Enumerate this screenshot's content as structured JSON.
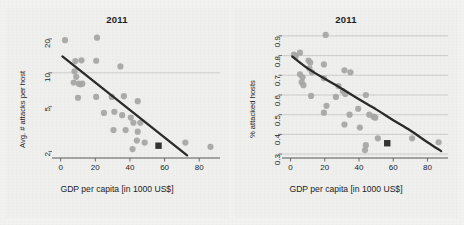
{
  "figure": {
    "background_color": "#f2f2f1",
    "panel_background": "#efefee",
    "point_color": "#a6a6a6",
    "highlight_color": "#333333",
    "fit_line_color": "#2b2b2b",
    "grid_color": "#bfbfbf",
    "axis_color": "#4a4a4a"
  },
  "chart_data": [
    {
      "type": "scatter",
      "panel": "left",
      "title": "2011",
      "xlabel": "GDP per capita [in 1000 US$]",
      "ylabel": "Avg. # attacks per host",
      "xticks": [
        0,
        20,
        40,
        60,
        80
      ],
      "xticklabels": [
        "0",
        "20",
        "40",
        "60",
        "80"
      ],
      "yticks": [
        2,
        5,
        10,
        20
      ],
      "yticklabels": [
        "2",
        "5",
        "10",
        "20"
      ],
      "yscale": "log",
      "xlim": [
        -5,
        92
      ],
      "ylim": [
        1.75,
        24
      ],
      "grid": "y at 10",
      "gridlines": [
        10
      ],
      "legend": "none",
      "points": [
        {
          "x": 2.5,
          "y": 19.5
        },
        {
          "x": 21.0,
          "y": 20.5
        },
        {
          "x": 8.5,
          "y": 12.7
        },
        {
          "x": 12.0,
          "y": 12.9
        },
        {
          "x": 20.5,
          "y": 12.8
        },
        {
          "x": 34.5,
          "y": 11.4
        },
        {
          "x": 8.0,
          "y": 10.3
        },
        {
          "x": 9.0,
          "y": 9.2
        },
        {
          "x": 7.5,
          "y": 8.2
        },
        {
          "x": 10.5,
          "y": 8.0
        },
        {
          "x": 12.5,
          "y": 8.0
        },
        {
          "x": 11.5,
          "y": 7.9
        },
        {
          "x": 10.0,
          "y": 6.0
        },
        {
          "x": 20.5,
          "y": 6.1
        },
        {
          "x": 29.5,
          "y": 6.1
        },
        {
          "x": 36.5,
          "y": 6.2
        },
        {
          "x": 44.5,
          "y": 5.6
        },
        {
          "x": 25.0,
          "y": 4.4
        },
        {
          "x": 31.0,
          "y": 4.5
        },
        {
          "x": 35.5,
          "y": 4.2
        },
        {
          "x": 40.5,
          "y": 4.0
        },
        {
          "x": 42.0,
          "y": 3.6
        },
        {
          "x": 46.0,
          "y": 3.6
        },
        {
          "x": 30.5,
          "y": 3.1
        },
        {
          "x": 37.5,
          "y": 3.1
        },
        {
          "x": 44.5,
          "y": 3.0
        },
        {
          "x": 44.0,
          "y": 2.5
        },
        {
          "x": 41.5,
          "y": 2.1
        },
        {
          "x": 48.5,
          "y": 2.4
        },
        {
          "x": 72.0,
          "y": 2.4
        },
        {
          "x": 86.5,
          "y": 2.2
        }
      ],
      "highlight_point": {
        "x": 56.5,
        "y": 2.25,
        "marker": "square"
      },
      "fit_line": {
        "x": [
          1.0,
          73.0
        ],
        "y": [
          14.0,
          1.85
        ],
        "style": "straight-on-log"
      }
    },
    {
      "type": "scatter",
      "panel": "right",
      "title": "2011",
      "xlabel": "GDP per capita [in 1000 US$]",
      "ylabel": "% attacked hosts",
      "xticks": [
        0,
        20,
        40,
        60,
        80
      ],
      "xticklabels": [
        "0",
        "20",
        "40",
        "60",
        "80"
      ],
      "yticks": [
        0.3,
        0.4,
        0.5,
        0.6,
        0.7,
        0.8,
        0.9
      ],
      "yticklabels": [
        "0.3",
        "0.4",
        "0.5",
        "0.6",
        "0.7",
        "0.8",
        "0.9"
      ],
      "yscale": "linear",
      "xlim": [
        -5,
        92
      ],
      "ylim": [
        0.28,
        0.93
      ],
      "grid": "horizontal",
      "gridlines": [
        0.3,
        0.4,
        0.5,
        0.6,
        0.7,
        0.8,
        0.9
      ],
      "legend": "none",
      "points": [
        {
          "x": 20.5,
          "y": 0.905
        },
        {
          "x": 5.5,
          "y": 0.815
        },
        {
          "x": 2.0,
          "y": 0.805
        },
        {
          "x": 3.0,
          "y": 0.795
        },
        {
          "x": 10.5,
          "y": 0.775
        },
        {
          "x": 11.5,
          "y": 0.765
        },
        {
          "x": 19.5,
          "y": 0.755
        },
        {
          "x": 11.0,
          "y": 0.735
        },
        {
          "x": 12.5,
          "y": 0.715
        },
        {
          "x": 5.5,
          "y": 0.705
        },
        {
          "x": 31.5,
          "y": 0.725
        },
        {
          "x": 35.0,
          "y": 0.715
        },
        {
          "x": 7.0,
          "y": 0.69
        },
        {
          "x": 19.5,
          "y": 0.685
        },
        {
          "x": 6.5,
          "y": 0.665
        },
        {
          "x": 7.5,
          "y": 0.65
        },
        {
          "x": 28.0,
          "y": 0.645
        },
        {
          "x": 30.5,
          "y": 0.62
        },
        {
          "x": 32.0,
          "y": 0.605
        },
        {
          "x": 12.0,
          "y": 0.595
        },
        {
          "x": 26.5,
          "y": 0.59
        },
        {
          "x": 44.0,
          "y": 0.6
        },
        {
          "x": 21.0,
          "y": 0.545
        },
        {
          "x": 39.5,
          "y": 0.53
        },
        {
          "x": 19.5,
          "y": 0.51
        },
        {
          "x": 34.5,
          "y": 0.5
        },
        {
          "x": 46.0,
          "y": 0.5
        },
        {
          "x": 48.5,
          "y": 0.49
        },
        {
          "x": 49.5,
          "y": 0.485
        },
        {
          "x": 31.5,
          "y": 0.45
        },
        {
          "x": 40.5,
          "y": 0.435
        },
        {
          "x": 51.0,
          "y": 0.38
        },
        {
          "x": 44.0,
          "y": 0.345
        },
        {
          "x": 43.5,
          "y": 0.32
        },
        {
          "x": 71.0,
          "y": 0.38
        },
        {
          "x": 86.5,
          "y": 0.36
        }
      ],
      "highlight_point": {
        "x": 56.5,
        "y": 0.355,
        "marker": "square"
      },
      "fit_line": {
        "x": [
          1.0,
          10.0,
          20.0,
          30.0,
          40.0,
          50.0,
          60.0,
          70.0,
          80.0,
          88.0
        ],
        "y": [
          0.795,
          0.735,
          0.682,
          0.632,
          0.578,
          0.527,
          0.472,
          0.42,
          0.36,
          0.315
        ],
        "style": "curve"
      }
    }
  ]
}
